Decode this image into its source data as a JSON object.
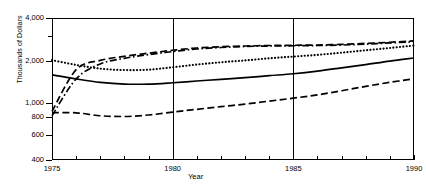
{
  "chart_data": {
    "type": "line",
    "title": "",
    "xlabel": "Year",
    "ylabel": "Thousands of Dollars",
    "xlim": [
      1975,
      1990
    ],
    "ylim": [
      400,
      4000
    ],
    "yscale": "log",
    "grid": "vertical gridlines at 1980 and 1985",
    "legend": "none",
    "x_ticklabels": [
      "1975",
      "1980",
      "1985",
      "1990"
    ],
    "x_ticks_major": [
      1975,
      1980,
      1985,
      1990
    ],
    "x_ticks_minor": [
      1976,
      1977,
      1978,
      1979,
      1981,
      1982,
      1983,
      1984,
      1986,
      1987,
      1988,
      1989
    ],
    "y_ticklabels": [
      "4,000",
      "2,000",
      "1,000",
      "800",
      "600",
      "400"
    ],
    "y_ticks": [
      4000,
      2000,
      1000,
      800,
      600,
      400
    ],
    "y_ticks_minor": [
      3000
    ],
    "x": [
      1975,
      1976,
      1977,
      1978,
      1979,
      1980,
      1981,
      1982,
      1983,
      1984,
      1985,
      1986,
      1987,
      1988,
      1989,
      1990
    ],
    "series": [
      {
        "name": "dotted-series",
        "style": "dotted",
        "values": [
          2020,
          1870,
          1760,
          1720,
          1730,
          1800,
          1880,
          1950,
          2010,
          2080,
          2140,
          2200,
          2280,
          2370,
          2460,
          2560
        ]
      },
      {
        "name": "solid-series",
        "style": "solid",
        "values": [
          1590,
          1490,
          1410,
          1370,
          1370,
          1400,
          1440,
          1480,
          1520,
          1570,
          1620,
          1690,
          1780,
          1880,
          1990,
          2090
        ]
      },
      {
        "name": "dash-dot-series",
        "style": "dash-dot",
        "values": [
          820,
          1490,
          1900,
          2080,
          2210,
          2320,
          2420,
          2480,
          2520,
          2540,
          2550,
          2560,
          2580,
          2620,
          2670,
          2720
        ]
      },
      {
        "name": "dashed-upper-series",
        "style": "dashed-long",
        "values": [
          880,
          1730,
          2010,
          2150,
          2260,
          2370,
          2460,
          2510,
          2540,
          2560,
          2570,
          2580,
          2610,
          2650,
          2700,
          2760
        ]
      },
      {
        "name": "dashed-lower-series",
        "style": "dashed",
        "values": [
          860,
          860,
          820,
          810,
          830,
          870,
          910,
          950,
          990,
          1040,
          1090,
          1150,
          1230,
          1320,
          1410,
          1490
        ]
      }
    ]
  }
}
